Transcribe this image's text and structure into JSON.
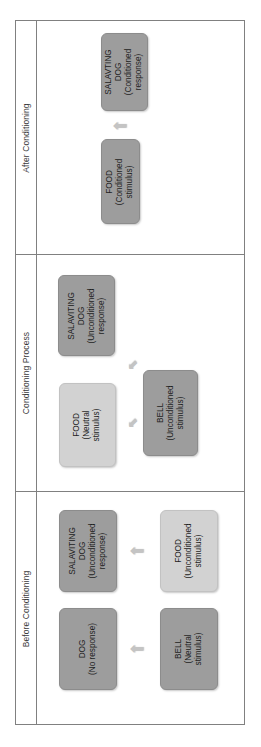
{
  "diagram": {
    "orientation": "rotated-90",
    "colors": {
      "dark_box": "#9d9d9d",
      "light_box": "#d2d2d2",
      "arrow": "#c4c4c4",
      "frame_line": "#808080",
      "text": "#1d1d1d",
      "background": "#ffffff"
    }
  },
  "sections": [
    {
      "id": "after-conditioning",
      "label": "After Conditioning",
      "nodes": [
        {
          "id": "after-food",
          "line1": "FOOD",
          "line2": "(Conditioned",
          "line3": "stimulus)",
          "shade": "dark"
        },
        {
          "id": "after-salivating-dog",
          "line1": "SALAVTING",
          "line2": "DOG",
          "line3": "(Conditioned",
          "line4": "response)",
          "shade": "dark"
        }
      ],
      "arrows": [
        {
          "id": "after-arrow",
          "glyph": "⬆",
          "icon": "block-arrow-icon"
        }
      ]
    },
    {
      "id": "conditioning-process",
      "label": "Conditioning Process",
      "nodes": [
        {
          "id": "process-food",
          "line1": "FOOD",
          "line2": "(Neutral",
          "line3": "stimulus)",
          "shade": "light"
        },
        {
          "id": "process-bell",
          "line1": "BELL",
          "line2": "(Unconditioned",
          "line3": "stimulus)",
          "shade": "dark"
        },
        {
          "id": "process-salivating-dog",
          "line1": "SALAVITING",
          "line2": "DOG",
          "line3": "(Unconditioned",
          "line4": "response)",
          "shade": "dark"
        }
      ],
      "arrows": [
        {
          "id": "process-arrow-upper",
          "glyph": "⬆",
          "icon": "block-arrow-icon"
        },
        {
          "id": "process-arrow-lower",
          "glyph": "⬆",
          "icon": "block-arrow-icon"
        }
      ]
    },
    {
      "id": "before-conditioning",
      "label": "Before Conditioning",
      "nodes": [
        {
          "id": "before-food",
          "line1": "FOOD",
          "line2": "(Unconditioned",
          "line3": "stimulus)",
          "shade": "light"
        },
        {
          "id": "before-bell",
          "line1": "BELL",
          "line2": "(Neutral",
          "line3": "stimulus)",
          "shade": "dark"
        },
        {
          "id": "before-salivating-dog",
          "line1": "SALAVITING",
          "line2": "DOG",
          "line3": "(Unconditioned",
          "line4": "response)",
          "shade": "dark"
        },
        {
          "id": "before-dog",
          "line1": "DOG",
          "line2": "(No response)",
          "shade": "dark"
        }
      ],
      "arrows": [
        {
          "id": "before-arrow-top",
          "glyph": "⬆",
          "icon": "block-arrow-icon"
        },
        {
          "id": "before-arrow-bottom",
          "glyph": "⬆",
          "icon": "block-arrow-icon"
        }
      ]
    }
  ]
}
